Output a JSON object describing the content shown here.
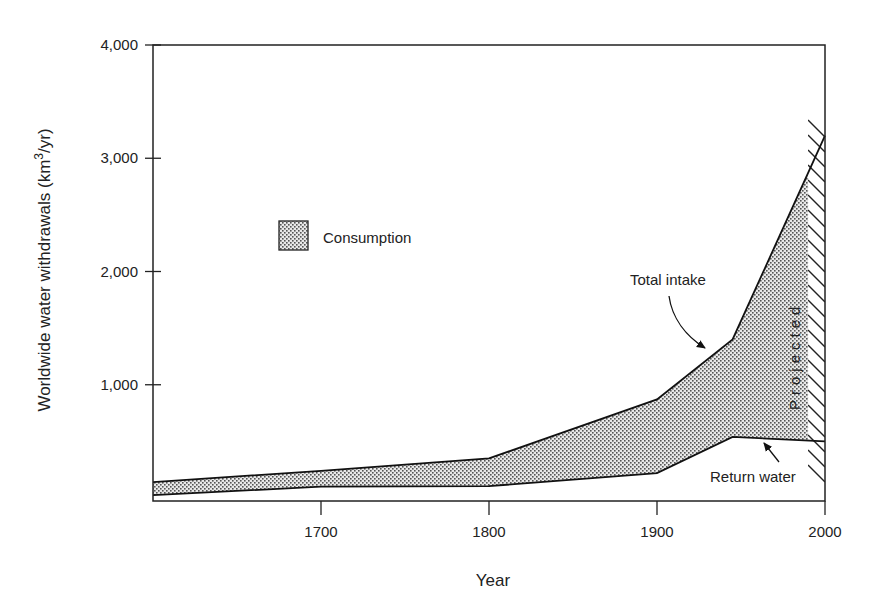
{
  "chart_data": {
    "type": "area",
    "title": "",
    "xlabel": "Year",
    "ylabel": "Worldwide water withdrawals  (km3/yr)",
    "ylabel_parts": {
      "main": "Worldwide water withdrawals  (km",
      "sup": "3",
      "tail": "/yr)"
    },
    "xlim": [
      1600,
      2000
    ],
    "ylim": [
      0,
      4000
    ],
    "x_ticks": [
      1700,
      1800,
      1900,
      2000
    ],
    "x_tick_labels": [
      "1700",
      "1800",
      "1900",
      "2000"
    ],
    "y_ticks": [
      1000,
      2000,
      3000,
      4000
    ],
    "y_tick_labels": [
      "1,000",
      "2,000",
      "3,000",
      "4,000"
    ],
    "grid": false,
    "series": [
      {
        "name": "Total intake",
        "x": [
          1600,
          1700,
          1800,
          1900,
          1945,
          2000
        ],
        "values": [
          140,
          240,
          350,
          870,
          1400,
          3200
        ]
      },
      {
        "name": "Return water",
        "x": [
          1600,
          1700,
          1800,
          1900,
          1945,
          2000
        ],
        "values": [
          25,
          100,
          105,
          220,
          540,
          500
        ]
      }
    ],
    "filled_region": {
      "name": "Consumption",
      "between": [
        "Return water",
        "Total intake"
      ],
      "pattern": "stipple"
    },
    "projected_region": {
      "label": "Projected",
      "x_start": 1990,
      "x_end": 2000,
      "pattern": "hatch"
    },
    "legend": {
      "entries": [
        "Consumption"
      ],
      "position": "upper-left inside"
    },
    "annotations": [
      {
        "text": "Total intake",
        "arrow_to": [
          1930,
          1300
        ]
      },
      {
        "text": "Return water",
        "arrow_to": [
          1963,
          540
        ]
      },
      {
        "text": "Projected",
        "rotation": -90
      }
    ]
  },
  "legend": {
    "consumption_label": "Consumption"
  },
  "labels": {
    "total_intake": "Total intake",
    "return_water": "Return water",
    "projected": "Projected",
    "xlabel": "Year"
  }
}
